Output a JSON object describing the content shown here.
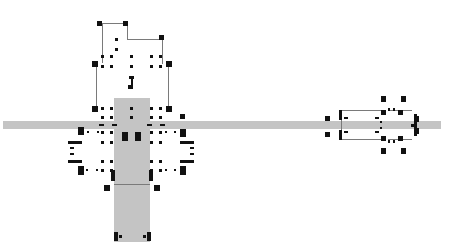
{
  "diagram": {
    "background": "#ffffff",
    "fill_color": "#c4c4c4",
    "handle_color": "#111111",
    "line_color": "#7a7a7a",
    "shapes": [
      {
        "name": "horizontal-bar",
        "x": 3,
        "y": 121,
        "w": 438,
        "h": 8
      },
      {
        "name": "vertical-column",
        "x": 114,
        "y": 98,
        "w": 36,
        "h": 144
      }
    ],
    "lines": [
      {
        "name": "top-bracket-left",
        "x": 102,
        "y": 23,
        "w": 1,
        "h": 40
      },
      {
        "name": "top-bracket-top",
        "x": 102,
        "y": 23,
        "w": 26,
        "h": 1
      },
      {
        "name": "top-bracket-mid",
        "x": 127,
        "y": 23,
        "w": 1,
        "h": 17
      },
      {
        "name": "top-bracket-right-top",
        "x": 127,
        "y": 39,
        "w": 36,
        "h": 1
      },
      {
        "name": "top-bracket-right",
        "x": 162,
        "y": 39,
        "w": 1,
        "h": 25
      },
      {
        "name": "left-vertical",
        "x": 96,
        "y": 64,
        "w": 1,
        "h": 44
      },
      {
        "name": "right-vertical",
        "x": 168,
        "y": 64,
        "w": 1,
        "h": 44
      },
      {
        "name": "column-divider",
        "x": 114,
        "y": 184,
        "w": 36,
        "h": 1
      },
      {
        "name": "right-group-top",
        "x": 342,
        "y": 110,
        "w": 42,
        "h": 1
      },
      {
        "name": "right-group-bottom",
        "x": 342,
        "y": 139,
        "w": 42,
        "h": 1
      },
      {
        "name": "right-group-top-2",
        "x": 388,
        "y": 110,
        "w": 24,
        "h": 1
      },
      {
        "name": "right-group-bottom-2",
        "x": 388,
        "y": 139,
        "w": 24,
        "h": 1
      },
      {
        "name": "right-group-left",
        "x": 341,
        "y": 110,
        "w": 1,
        "h": 30
      }
    ],
    "handles": [
      {
        "x": 97,
        "y": 21,
        "w": 5,
        "h": 5
      },
      {
        "x": 123,
        "y": 21,
        "w": 5,
        "h": 5
      },
      {
        "x": 159,
        "y": 35,
        "w": 5,
        "h": 5
      },
      {
        "x": 115,
        "y": 38,
        "w": 3,
        "h": 3
      },
      {
        "x": 115,
        "y": 48,
        "w": 3,
        "h": 3
      },
      {
        "x": 101,
        "y": 55,
        "w": 3,
        "h": 3
      },
      {
        "x": 110,
        "y": 55,
        "w": 3,
        "h": 3
      },
      {
        "x": 130,
        "y": 55,
        "w": 3,
        "h": 3
      },
      {
        "x": 150,
        "y": 55,
        "w": 3,
        "h": 3
      },
      {
        "x": 159,
        "y": 55,
        "w": 3,
        "h": 3
      },
      {
        "x": 92,
        "y": 61,
        "w": 6,
        "h": 6
      },
      {
        "x": 166,
        "y": 61,
        "w": 6,
        "h": 6
      },
      {
        "x": 101,
        "y": 65,
        "w": 3,
        "h": 3
      },
      {
        "x": 110,
        "y": 65,
        "w": 3,
        "h": 3
      },
      {
        "x": 130,
        "y": 65,
        "w": 3,
        "h": 3
      },
      {
        "x": 150,
        "y": 65,
        "w": 3,
        "h": 3
      },
      {
        "x": 159,
        "y": 65,
        "w": 3,
        "h": 3
      },
      {
        "x": 129,
        "y": 76,
        "w": 5,
        "h": 3
      },
      {
        "x": 131,
        "y": 78,
        "w": 2,
        "h": 8
      },
      {
        "x": 128,
        "y": 85,
        "w": 5,
        "h": 4
      },
      {
        "x": 92,
        "y": 106,
        "w": 6,
        "h": 6
      },
      {
        "x": 166,
        "y": 106,
        "w": 6,
        "h": 6
      },
      {
        "x": 101,
        "y": 107,
        "w": 3,
        "h": 3
      },
      {
        "x": 110,
        "y": 107,
        "w": 3,
        "h": 3
      },
      {
        "x": 130,
        "y": 107,
        "w": 3,
        "h": 3
      },
      {
        "x": 150,
        "y": 107,
        "w": 3,
        "h": 3
      },
      {
        "x": 159,
        "y": 107,
        "w": 3,
        "h": 3
      },
      {
        "x": 180,
        "y": 114,
        "w": 5,
        "h": 5
      },
      {
        "x": 101,
        "y": 116,
        "w": 3,
        "h": 3
      },
      {
        "x": 110,
        "y": 116,
        "w": 3,
        "h": 3
      },
      {
        "x": 130,
        "y": 116,
        "w": 3,
        "h": 3
      },
      {
        "x": 150,
        "y": 116,
        "w": 3,
        "h": 3
      },
      {
        "x": 159,
        "y": 116,
        "w": 3,
        "h": 3
      },
      {
        "x": 99,
        "y": 124,
        "w": 5,
        "h": 2
      },
      {
        "x": 112,
        "y": 124,
        "w": 5,
        "h": 2
      },
      {
        "x": 147,
        "y": 124,
        "w": 5,
        "h": 2
      },
      {
        "x": 160,
        "y": 124,
        "w": 5,
        "h": 2
      },
      {
        "x": 78,
        "y": 127,
        "w": 6,
        "h": 8
      },
      {
        "x": 180,
        "y": 129,
        "w": 6,
        "h": 8
      },
      {
        "x": 87,
        "y": 131,
        "w": 2,
        "h": 2
      },
      {
        "x": 97,
        "y": 131,
        "w": 2,
        "h": 2
      },
      {
        "x": 101,
        "y": 131,
        "w": 3,
        "h": 3
      },
      {
        "x": 110,
        "y": 131,
        "w": 3,
        "h": 3
      },
      {
        "x": 150,
        "y": 131,
        "w": 3,
        "h": 3
      },
      {
        "x": 159,
        "y": 131,
        "w": 3,
        "h": 3
      },
      {
        "x": 165,
        "y": 131,
        "w": 2,
        "h": 2
      },
      {
        "x": 174,
        "y": 131,
        "w": 2,
        "h": 2
      },
      {
        "x": 122,
        "y": 132,
        "w": 6,
        "h": 9
      },
      {
        "x": 135,
        "y": 132,
        "w": 6,
        "h": 9
      },
      {
        "x": 68,
        "y": 141,
        "w": 14,
        "h": 3
      },
      {
        "x": 180,
        "y": 141,
        "w": 14,
        "h": 3
      },
      {
        "x": 101,
        "y": 141,
        "w": 3,
        "h": 3
      },
      {
        "x": 110,
        "y": 141,
        "w": 3,
        "h": 3
      },
      {
        "x": 150,
        "y": 141,
        "w": 3,
        "h": 3
      },
      {
        "x": 159,
        "y": 141,
        "w": 3,
        "h": 3
      },
      {
        "x": 70,
        "y": 147,
        "w": 4,
        "h": 2
      },
      {
        "x": 190,
        "y": 147,
        "w": 4,
        "h": 2
      },
      {
        "x": 70,
        "y": 153,
        "w": 4,
        "h": 2
      },
      {
        "x": 190,
        "y": 147,
        "w": 4,
        "h": 2
      },
      {
        "x": 190,
        "y": 153,
        "w": 4,
        "h": 2
      },
      {
        "x": 68,
        "y": 160,
        "w": 14,
        "h": 3
      },
      {
        "x": 180,
        "y": 160,
        "w": 14,
        "h": 3
      },
      {
        "x": 101,
        "y": 160,
        "w": 3,
        "h": 3
      },
      {
        "x": 110,
        "y": 160,
        "w": 3,
        "h": 3
      },
      {
        "x": 150,
        "y": 160,
        "w": 3,
        "h": 3
      },
      {
        "x": 159,
        "y": 160,
        "w": 3,
        "h": 3
      },
      {
        "x": 78,
        "y": 166,
        "w": 6,
        "h": 9
      },
      {
        "x": 180,
        "y": 166,
        "w": 6,
        "h": 9
      },
      {
        "x": 86,
        "y": 169,
        "w": 2,
        "h": 2
      },
      {
        "x": 96,
        "y": 169,
        "w": 2,
        "h": 2
      },
      {
        "x": 101,
        "y": 169,
        "w": 3,
        "h": 3
      },
      {
        "x": 110,
        "y": 169,
        "w": 3,
        "h": 3
      },
      {
        "x": 150,
        "y": 169,
        "w": 3,
        "h": 3
      },
      {
        "x": 159,
        "y": 169,
        "w": 3,
        "h": 3
      },
      {
        "x": 165,
        "y": 169,
        "w": 2,
        "h": 2
      },
      {
        "x": 174,
        "y": 169,
        "w": 2,
        "h": 2
      },
      {
        "x": 111,
        "y": 170,
        "w": 4,
        "h": 11
      },
      {
        "x": 149,
        "y": 170,
        "w": 4,
        "h": 11
      },
      {
        "x": 104,
        "y": 185,
        "w": 6,
        "h": 6
      },
      {
        "x": 154,
        "y": 185,
        "w": 6,
        "h": 6
      },
      {
        "x": 114,
        "y": 232,
        "w": 4,
        "h": 9
      },
      {
        "x": 147,
        "y": 232,
        "w": 4,
        "h": 9
      },
      {
        "x": 119,
        "y": 235,
        "w": 3,
        "h": 3
      },
      {
        "x": 143,
        "y": 235,
        "w": 3,
        "h": 3
      },
      {
        "x": 325,
        "y": 116,
        "w": 5,
        "h": 5
      },
      {
        "x": 325,
        "y": 132,
        "w": 5,
        "h": 5
      },
      {
        "x": 339,
        "y": 110,
        "w": 3,
        "h": 10
      },
      {
        "x": 339,
        "y": 130,
        "w": 3,
        "h": 10
      },
      {
        "x": 344,
        "y": 117,
        "w": 4,
        "h": 2
      },
      {
        "x": 344,
        "y": 131,
        "w": 4,
        "h": 2
      },
      {
        "x": 375,
        "y": 117,
        "w": 4,
        "h": 2
      },
      {
        "x": 375,
        "y": 131,
        "w": 4,
        "h": 2
      },
      {
        "x": 381,
        "y": 96,
        "w": 5,
        "h": 6
      },
      {
        "x": 401,
        "y": 96,
        "w": 5,
        "h": 6
      },
      {
        "x": 381,
        "y": 148,
        "w": 5,
        "h": 6
      },
      {
        "x": 401,
        "y": 148,
        "w": 5,
        "h": 6
      },
      {
        "x": 381,
        "y": 110,
        "w": 5,
        "h": 5
      },
      {
        "x": 398,
        "y": 110,
        "w": 5,
        "h": 5
      },
      {
        "x": 381,
        "y": 136,
        "w": 5,
        "h": 5
      },
      {
        "x": 398,
        "y": 136,
        "w": 5,
        "h": 5
      },
      {
        "x": 388,
        "y": 108,
        "w": 2,
        "h": 3
      },
      {
        "x": 393,
        "y": 108,
        "w": 2,
        "h": 3
      },
      {
        "x": 388,
        "y": 140,
        "w": 2,
        "h": 3
      },
      {
        "x": 393,
        "y": 140,
        "w": 2,
        "h": 3
      },
      {
        "x": 380,
        "y": 121,
        "w": 2,
        "h": 2
      },
      {
        "x": 380,
        "y": 127,
        "w": 2,
        "h": 2
      },
      {
        "x": 414,
        "y": 114,
        "w": 3,
        "h": 22
      },
      {
        "x": 416,
        "y": 116,
        "w": 3,
        "h": 6
      },
      {
        "x": 416,
        "y": 128,
        "w": 3,
        "h": 6
      },
      {
        "x": 411,
        "y": 124,
        "w": 3,
        "h": 3
      }
    ]
  }
}
